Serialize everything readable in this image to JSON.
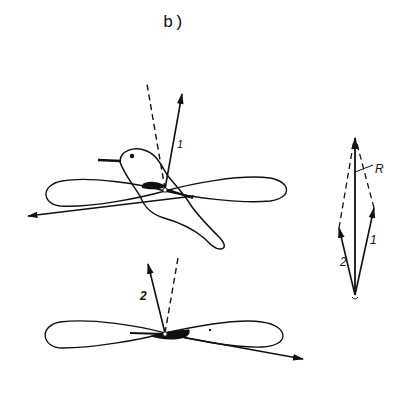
{
  "figure": {
    "panel_label": "b)"
  },
  "top_scene": {
    "subject": "hummingbird",
    "force_label": "1",
    "path_shape": "figure-eight"
  },
  "bottom_scene": {
    "force_label": "2",
    "path_shape": "figure-eight"
  },
  "vector_diagram": {
    "label_force_1": "1",
    "label_force_2": "2",
    "label_resultant": "R"
  },
  "colors": {
    "ink": "#111111",
    "background": "#ffffff"
  }
}
